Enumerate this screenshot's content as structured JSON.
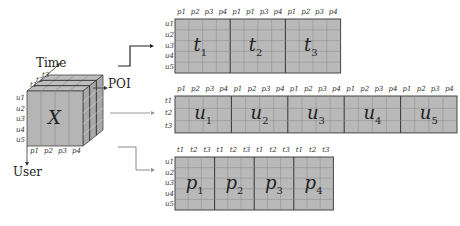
{
  "axes": {
    "time": "Time",
    "poi": "POI",
    "user": "User"
  },
  "cube": {
    "symbol": "X",
    "time_labels": [
      "t1",
      "t2",
      "t3"
    ],
    "user_labels": [
      "u1",
      "u2",
      "u3",
      "u4",
      "u5"
    ],
    "poi_labels": [
      "p1",
      "p2",
      "p3",
      "p4"
    ]
  },
  "unfold_time": {
    "blocks": [
      "t1",
      "t2",
      "t3"
    ],
    "col_headers": [
      [
        "p1",
        "p2",
        "p3",
        "p4"
      ],
      [
        "p1",
        "p1",
        "p3",
        "p4"
      ],
      [
        "p1",
        "p2",
        "p3",
        "p4"
      ]
    ],
    "row_labels": [
      "u1",
      "u2",
      "u3",
      "u4",
      "u5"
    ]
  },
  "unfold_user": {
    "blocks": [
      "u1",
      "u2",
      "u3",
      "u4",
      "u5"
    ],
    "col_headers": [
      "p1",
      "p2",
      "p3",
      "p4"
    ],
    "row_labels": [
      "t1",
      "t2",
      "t3"
    ]
  },
  "unfold_poi": {
    "blocks": [
      "p1",
      "p2",
      "p3",
      "p4"
    ],
    "col_headers": [
      "t1",
      "t2",
      "t3"
    ],
    "row_labels": [
      "u1",
      "u2",
      "u3",
      "u4",
      "u5"
    ]
  }
}
